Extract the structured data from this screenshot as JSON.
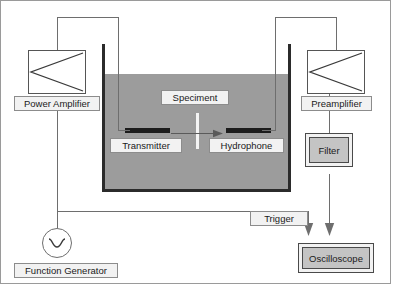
{
  "diagram": {
    "colors": {
      "water": "#9c9c9c",
      "tank_wall": "#2b2b2b",
      "transducer": "#1c1c1c",
      "wire": "#6e6e6e",
      "label_fill": "#f2f2f2",
      "device_fill": "#c4c4c4"
    }
  },
  "blocks": {
    "power_amplifier": {
      "label": "Power Amplifier",
      "symbol": "amplifier-triangle"
    },
    "preamplifier": {
      "label": "Preamplifier",
      "symbol": "amplifier-triangle"
    },
    "function_generator": {
      "label": "Function Generator",
      "symbol": "sine-wave-circle"
    },
    "filter": {
      "label": "Filter"
    },
    "oscilloscope": {
      "label": "Oscilloscope"
    },
    "trigger": {
      "label": "Trigger"
    }
  },
  "tank": {
    "specimen": {
      "label": "Speciment"
    },
    "transmitter": {
      "label": "Transmitter"
    },
    "hydrophone": {
      "label": "Hydrophone"
    }
  }
}
